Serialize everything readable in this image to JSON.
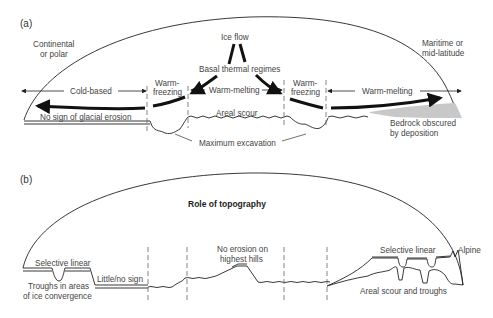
{
  "panel_a": {
    "label": "(a)",
    "left_climate": [
      "Continental",
      "or polar"
    ],
    "right_climate": [
      "Maritime or",
      "mid-latitude"
    ],
    "ice_flow": "Ice flow",
    "basal_thermal": "Basal thermal regimes",
    "zones": {
      "cold_based": "Cold-based",
      "warm_freezing_1": [
        "Warm-",
        "freezing"
      ],
      "warm_melting_1": "Warm-melting",
      "warm_freezing_2": [
        "Warm-",
        "freezing"
      ],
      "warm_melting_2": "Warm-melting"
    },
    "no_sign": "No sign of glacial erosion",
    "areal_scour": "Areal scour",
    "max_excavation": "Maximum excavation",
    "bedrock": [
      "Bedrock obscured",
      "by deposition"
    ],
    "deposition_color": "#c8c8c8"
  },
  "panel_b": {
    "label": "(b)",
    "title": "Role of topography",
    "selective_linear_left": "Selective linear",
    "troughs": [
      "Troughs in areas",
      "of ice convergence"
    ],
    "little_no_sign": "Little/no sign",
    "no_erosion": [
      "No erosion on",
      "highest hills"
    ],
    "selective_linear_right": "Selective linear",
    "alpine": "Alpine",
    "areal_scour_troughs": "Areal scour and troughs"
  }
}
